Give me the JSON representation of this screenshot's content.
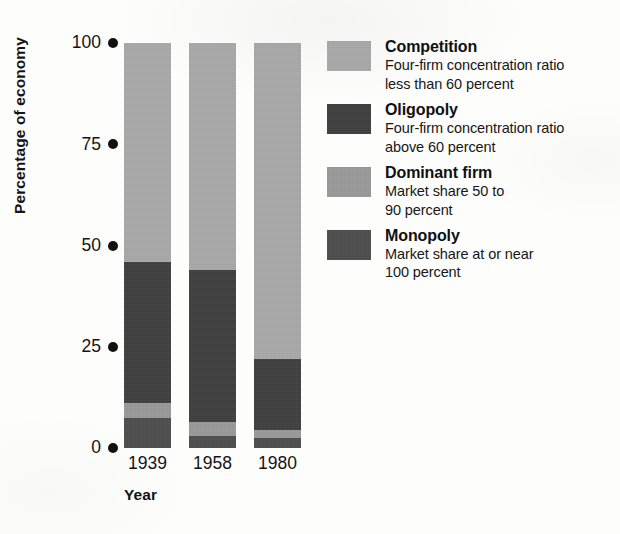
{
  "chart_data": {
    "type": "bar",
    "subtype": "stacked-bar-100",
    "title": "",
    "xlabel": "Year",
    "ylabel": "Percentage of economy",
    "categories": [
      "1939",
      "1958",
      "1980"
    ],
    "ylim": [
      0,
      100
    ],
    "yticks": [
      0,
      25,
      50,
      75,
      100
    ],
    "ytick_labels": [
      "0",
      "25",
      "50",
      "75",
      "100"
    ],
    "grid": false,
    "legend_position": "right",
    "stack_order_bottom_to_top": [
      "Monopoly",
      "Dominant firm",
      "Oligopoly",
      "Competition"
    ],
    "series": [
      {
        "name": "Competition",
        "color": "#a9a9a9",
        "values": [
          54,
          56,
          78
        ]
      },
      {
        "name": "Oligopoly",
        "color": "#3f3f3f",
        "values": [
          35,
          37.5,
          17.5
        ]
      },
      {
        "name": "Dominant firm",
        "color": "#9a9a9a",
        "values": [
          3.5,
          3.5,
          2
        ]
      },
      {
        "name": "Monopoly",
        "color": "#4d4d4d",
        "values": [
          7.5,
          3,
          2.5
        ]
      }
    ],
    "cumulative_tops": {
      "1939": {
        "Monopoly": 7.5,
        "Dominant firm": 11,
        "Oligopoly": 46,
        "Competition": 100
      },
      "1958": {
        "Monopoly": 3,
        "Dominant firm": 6.5,
        "Oligopoly": 44,
        "Competition": 100
      },
      "1980": {
        "Monopoly": 2.5,
        "Dominant firm": 4.5,
        "Oligopoly": 22,
        "Competition": 100
      }
    }
  },
  "axes": {
    "y_title": "Percentage of economy",
    "x_title": "Year",
    "y_ticks": [
      {
        "label": "100",
        "value": 100
      },
      {
        "label": "75",
        "value": 75
      },
      {
        "label": "50",
        "value": 50
      },
      {
        "label": "25",
        "value": 25
      },
      {
        "label": "0",
        "value": 0
      }
    ],
    "x_ticks": [
      {
        "label": "1939"
      },
      {
        "label": "1958"
      },
      {
        "label": "1980"
      }
    ]
  },
  "legend": {
    "items": [
      {
        "title": "Competition",
        "description": "Four-firm concentration ratio\nless than 60 percent",
        "color": "#a9a9a9",
        "swatch_class": "sw-competition"
      },
      {
        "title": "Oligopoly",
        "description": "Four-firm concentration ratio\nabove 60 percent",
        "color": "#3f3f3f",
        "swatch_class": "sw-oligopoly"
      },
      {
        "title": "Dominant firm",
        "description": "Market share 50 to\n90 percent",
        "color": "#9a9a9a",
        "swatch_class": "sw-dominant"
      },
      {
        "title": "Monopoly",
        "description": "Market share at or near\n100 percent",
        "color": "#4d4d4d",
        "swatch_class": "sw-monopoly"
      }
    ]
  }
}
